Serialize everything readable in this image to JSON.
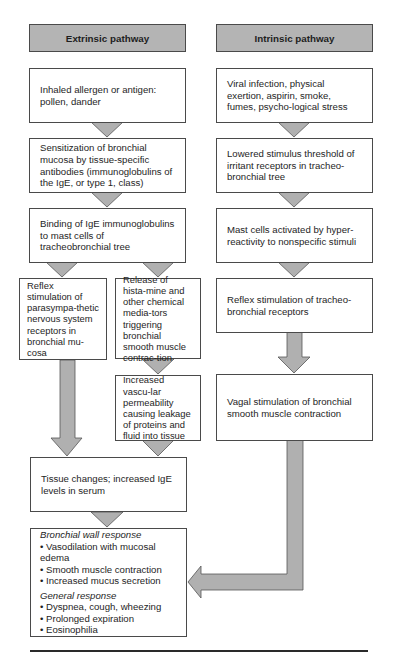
{
  "extrinsic": {
    "header": "Extrinsic pathway",
    "steps": [
      "Inhaled allergen or antigen: pollen, dander",
      "Sensitization of bronchial mucosa by tissue-specific antibodies (immunoglobulins of the IgE, or type 1, class)",
      "Binding of IgE immunoglobulins to mast cells of tracheobronchial tree"
    ],
    "branch_left": "Reflex stimulation of parasympa-thetic nervous system receptors in bronchial mu-cosa",
    "branch_right": "Release of hista-mine and other chemical media-tors triggering bronchial smooth muscle contrac-tion",
    "branch_right_next": "Increased vascu-lar permeability causing leakage of proteins and fluid into tissue",
    "merge": "Tissue changes; increased IgE levels in serum"
  },
  "intrinsic": {
    "header": "Intrinsic pathway",
    "steps": [
      "Viral infection, physical exertion, aspirin, smoke, fumes, psycho-logical stress",
      "Lowered stimulus threshold of irritant receptors in tracheo-bronchial tree",
      "Mast cells activated by hyper-reactivity to nonspecific stimuli",
      "Reflex stimulation of tracheo-bronchial receptors",
      "Vagal stimulation of bronchial smooth muscle contraction"
    ]
  },
  "outcome": {
    "bronchial_title": "Bronchial wall response",
    "bronchial_items": [
      "Vasodilation with mucosal edema",
      "Smooth muscle contraction",
      "Increased mucus secretion"
    ],
    "general_title": "General response",
    "general_items": [
      "Dyspnea, cough, wheezing",
      "Prolonged expiration",
      "Eosinophilia"
    ]
  },
  "colors": {
    "header_fill": "#b4b4b4",
    "arrow_fill": "#b0b0b0",
    "border": "#4a4a4a"
  }
}
